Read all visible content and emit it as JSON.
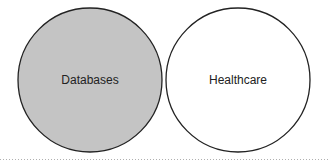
{
  "diagram": {
    "type": "disjoint-sets",
    "sets": [
      {
        "id": "databases",
        "label": "Databases",
        "fill": "#c4c4c4",
        "stroke": "#222222"
      },
      {
        "id": "healthcare",
        "label": "Healthcare",
        "fill": "#ffffff",
        "stroke": "#222222"
      }
    ],
    "separator": {
      "style": "dotted",
      "color": "#b0b0b0"
    }
  }
}
